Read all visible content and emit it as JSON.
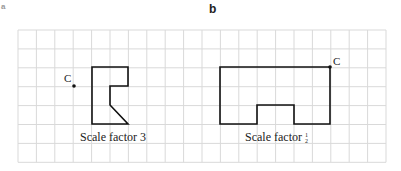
{
  "parts": {
    "a": {
      "label": "a",
      "caption": "Scale factor 3",
      "centre_label": "C"
    },
    "b": {
      "label": "b",
      "caption": "Scale factor",
      "fraction": "1/2",
      "centre_label": "C"
    }
  },
  "grid": {
    "cols": 20,
    "rows": 7,
    "line_color": "#d9d9d9"
  }
}
